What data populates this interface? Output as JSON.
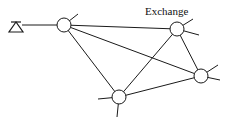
{
  "diagram": {
    "type": "network",
    "label": "Exchange",
    "label_pos": {
      "x": 145,
      "y": 5
    },
    "colors": {
      "stroke": "#1a1a1a",
      "background": "#ffffff"
    },
    "terminal": {
      "name": "subscriber-terminal",
      "x": 16,
      "y": 26
    },
    "nodes": [
      {
        "id": "A",
        "x": 64,
        "y": 25,
        "r": 7
      },
      {
        "id": "B",
        "x": 177,
        "y": 29,
        "r": 7
      },
      {
        "id": "C",
        "x": 201,
        "y": 76,
        "r": 7
      },
      {
        "id": "D",
        "x": 119,
        "y": 97,
        "r": 7
      }
    ],
    "edges": [
      [
        "A",
        "B"
      ],
      [
        "A",
        "C"
      ],
      [
        "A",
        "D"
      ],
      [
        "B",
        "C"
      ],
      [
        "B",
        "D"
      ],
      [
        "D",
        "C"
      ]
    ],
    "stubs": [
      {
        "from": "A",
        "x2": 78,
        "y2": 14
      },
      {
        "from": "B",
        "x2": 193,
        "y2": 19
      },
      {
        "from": "B",
        "x2": 199,
        "y2": 35
      },
      {
        "from": "C",
        "x2": 218,
        "y2": 65
      },
      {
        "from": "C",
        "x2": 220,
        "y2": 80
      },
      {
        "from": "D",
        "x2": 98,
        "y2": 99
      },
      {
        "from": "D",
        "x2": 117,
        "y2": 117
      }
    ]
  }
}
